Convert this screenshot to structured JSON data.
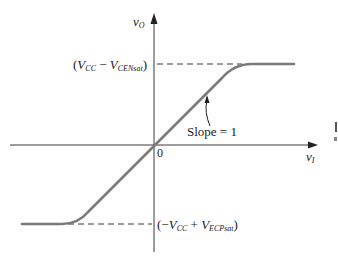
{
  "diagram": {
    "type": "transfer-characteristic",
    "colors": {
      "axis": "#3a3a3a",
      "curve": "#7a7a7a",
      "dash": "#3a3a3a",
      "text": "#222222",
      "background": "#ffffff"
    },
    "axes": {
      "y_label_main": "v",
      "y_label_sub": "O",
      "x_label_main": "v",
      "x_label_sub": "I",
      "origin_label": "0"
    },
    "levels": {
      "upper": {
        "open": "(",
        "v1": "V",
        "v1_sub": "CC",
        "op": " − ",
        "v2": "V",
        "v2_sub": "CENsat",
        "close": ")"
      },
      "lower": {
        "open": "(−",
        "v1": "V",
        "v1_sub": "CC",
        "op": " + ",
        "v2": "V",
        "v2_sub": "ECPsat",
        "close": ")"
      }
    },
    "annotation": {
      "slope_label": "Slope = 1"
    }
  }
}
